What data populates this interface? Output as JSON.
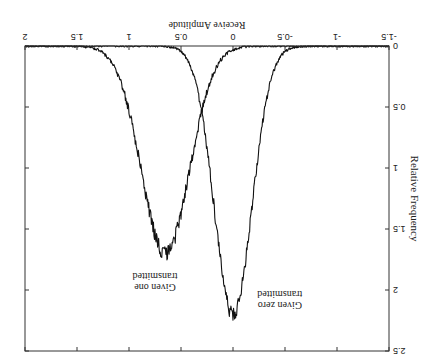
{
  "orientation": "rotated-180",
  "chart_data": {
    "type": "line",
    "title": "",
    "xlabel": "Receive Amplitude",
    "ylabel": "Relative Frequency",
    "xlim": [
      -1.5,
      2
    ],
    "ylim": [
      0,
      2.5
    ],
    "x_ticks": [
      "-1.5",
      "-1",
      "-0.5",
      "0",
      "0.5",
      "1",
      "1.5",
      "2"
    ],
    "y_ticks": [
      "0",
      "0.5",
      "1",
      "1.5",
      "2",
      "2.5"
    ],
    "grid": false,
    "legend": null,
    "series": [
      {
        "name": "Given zero transmitted",
        "distribution": "gaussian-noisy",
        "mean": 0.0,
        "peak": 2.2,
        "sigma": 0.18
      },
      {
        "name": "Given one transmitted",
        "distribution": "gaussian-noisy",
        "mean": 0.65,
        "peak": 1.7,
        "sigma": 0.23
      }
    ],
    "annotations": [
      {
        "text": "Given zero transmitted",
        "x": -0.45,
        "y": 2.1
      },
      {
        "text": "Given one transmitted",
        "x": 0.75,
        "y": 1.95
      }
    ]
  },
  "labels": {
    "xlabel": "Receive Amplitude",
    "ylabel": "Relative Frequency",
    "zero_line1": "Given zero",
    "zero_line2": "transmitted",
    "one_line1": "Given one",
    "one_line2": "transmitted"
  },
  "colors": {
    "line": "#111111",
    "axis": "#333333",
    "background": "#ffffff"
  }
}
